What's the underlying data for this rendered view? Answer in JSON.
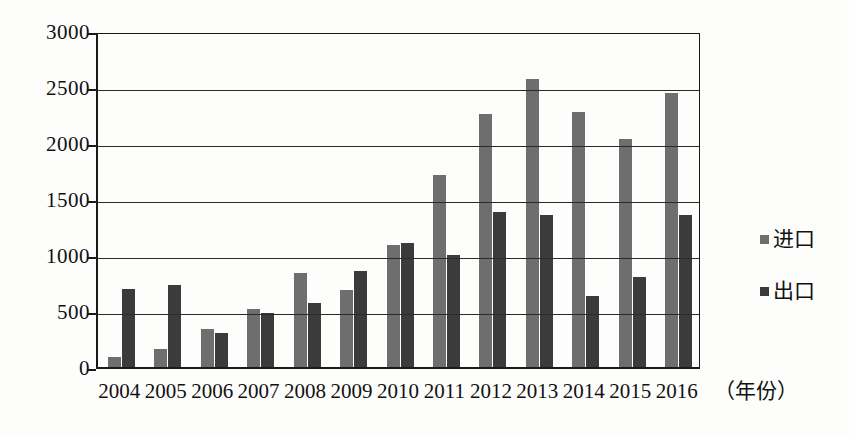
{
  "chart_data": {
    "type": "bar",
    "title": "",
    "xlabel": "（年份）",
    "ylabel": "",
    "ylim": [
      0,
      3000
    ],
    "ytick_step": 500,
    "yticks": [
      "3000",
      "2500",
      "2000",
      "1500",
      "1000",
      "500",
      "0"
    ],
    "grid": true,
    "legend_position": "right",
    "categories": [
      "2004",
      "2005",
      "2006",
      "2007",
      "2008",
      "2009",
      "2010",
      "2011",
      "2012",
      "2013",
      "2014",
      "2015",
      "2016"
    ],
    "series": [
      {
        "name": "进口",
        "color": "#6e6e6e",
        "values": [
          90,
          165,
          340,
          520,
          840,
          690,
          1090,
          1710,
          2260,
          2570,
          2280,
          2040,
          2450
        ]
      },
      {
        "name": "出口",
        "color": "#3b3b3b",
        "values": [
          700,
          730,
          300,
          480,
          570,
          860,
          1110,
          1000,
          1380,
          1360,
          630,
          800,
          1360
        ]
      }
    ]
  },
  "legend": {
    "items": [
      {
        "label": "进口",
        "swatch": "import"
      },
      {
        "label": "出口",
        "swatch": "export"
      }
    ]
  },
  "axis": {
    "x_title": "（年份）"
  }
}
